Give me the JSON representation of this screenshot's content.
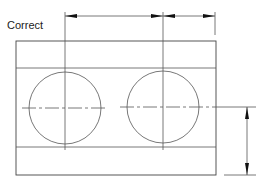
{
  "title": "Correct",
  "drawing": {
    "description": "Dimensioning example: plate with two circular holes",
    "part": {
      "outer_rect": {
        "x": 16,
        "y": 41,
        "w": 200,
        "h": 134
      },
      "inner_lines_y": [
        68,
        147
      ]
    },
    "holes": [
      {
        "name": "left-hole",
        "cx": 65,
        "cy": 108,
        "r": 36
      },
      {
        "name": "right-hole",
        "cx": 163,
        "cy": 107,
        "r": 36
      }
    ],
    "dimensions": {
      "horizontal": {
        "y": 16,
        "points_x": [
          65,
          163,
          215
        ]
      },
      "vertical": {
        "x": 247,
        "from_y": 107,
        "to_y": 175
      }
    },
    "colors": {
      "line": "#444444",
      "arrow": "#111111",
      "text": "#222222",
      "background": "#ffffff"
    }
  }
}
